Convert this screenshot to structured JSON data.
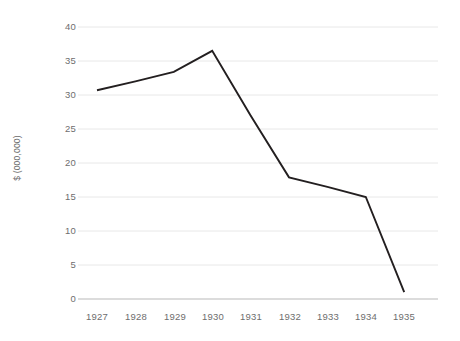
{
  "chart_data": {
    "type": "line",
    "title": "",
    "xlabel": "",
    "ylabel": "$ (000,000)",
    "categories": [
      "1927",
      "1928",
      "1929",
      "1930",
      "1931",
      "1932",
      "1933",
      "1934",
      "1935"
    ],
    "values": [
      30.7,
      32.0,
      33.4,
      36.5,
      27.0,
      17.9,
      16.5,
      15.0,
      1.0
    ],
    "series": [
      {
        "name": "",
        "values": [
          30.7,
          32.0,
          33.4,
          36.5,
          27.0,
          17.9,
          16.5,
          15.0,
          1.0
        ]
      }
    ],
    "vertex_years": [
      "1927",
      "1929",
      "1930",
      "1932",
      "1934",
      "1935"
    ],
    "vertex_values": [
      30.7,
      33.4,
      36.5,
      17.9,
      15.0,
      1.0
    ],
    "ylim": [
      0,
      40
    ],
    "ytick_values": [
      40,
      35,
      30,
      25,
      20,
      15,
      10,
      5,
      0
    ],
    "ytick_labels": [
      "40",
      "35",
      "30",
      "25",
      "20",
      "15",
      "10",
      "5",
      "0"
    ],
    "grid": true,
    "grid_axis": "y",
    "legend": "none",
    "line_color": "#231f20",
    "grid_color": "#e8e8e8",
    "axis_color": "#d8d8d8",
    "tick_label_color": "#6e6e6e",
    "background_color": "#ffffff"
  }
}
